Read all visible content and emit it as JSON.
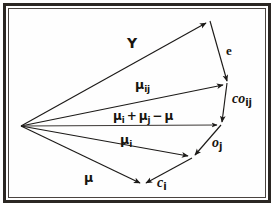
{
  "figure": {
    "background_color": "#ffffff",
    "line_color": "#1c1a18",
    "frame_color": "#2b2723"
  },
  "labels": {
    "upsilon": "Υ",
    "error": "e",
    "mu_ij_base": "μ",
    "mu_ij_sub": "ij",
    "co_base": "co",
    "co_sub": "ij",
    "sum_mu_i_base": "μ",
    "sum_mu_i_sub": "i",
    "sum_plus": "+",
    "sum_mu_j_base": "μ",
    "sum_mu_j_sub": "j",
    "sum_minus": "−",
    "sum_mu": "μ",
    "mu_i_base": "μ",
    "mu_i_sub": "i",
    "o_base": "o",
    "o_sub": "j",
    "mu": "μ",
    "c_base": "c",
    "c_sub": "i"
  },
  "geometry": {
    "origin": {
      "x": 21,
      "y": 126
    },
    "vertices": [
      {
        "name": "apex-upsilon",
        "x": 210,
        "y": 21
      },
      {
        "name": "point-mu-ij",
        "x": 227,
        "y": 83
      },
      {
        "name": "point-sum",
        "x": 221,
        "y": 125
      },
      {
        "name": "point-mu-i",
        "x": 192,
        "y": 158
      },
      {
        "name": "point-mu",
        "x": 143,
        "y": 185
      }
    ],
    "vectors": [
      {
        "name": "upsilon-vector",
        "from": "origin",
        "to": "apex-upsilon",
        "label": "upsilon"
      },
      {
        "name": "mu-ij-vector",
        "from": "origin",
        "to": "point-mu-ij",
        "label": "mu_ij"
      },
      {
        "name": "sum-vector",
        "from": "origin",
        "to": "point-sum",
        "label": "mu_i + mu_j - mu"
      },
      {
        "name": "mu-i-vector",
        "from": "origin",
        "to": "point-mu-i",
        "label": "mu_i"
      },
      {
        "name": "mu-vector",
        "from": "origin",
        "to": "point-mu",
        "label": "mu"
      },
      {
        "name": "e-segment",
        "from": "apex-upsilon",
        "to": "point-mu-ij",
        "label": "e"
      },
      {
        "name": "co-ij-segment",
        "from": "point-mu-ij",
        "to": "point-sum",
        "label": "co_ij"
      },
      {
        "name": "o-j-segment",
        "from": "point-sum",
        "to": "point-mu-i",
        "label": "o_j"
      },
      {
        "name": "c-i-segment",
        "from": "point-mu-i",
        "to": "point-mu",
        "label": "c_i"
      }
    ]
  }
}
